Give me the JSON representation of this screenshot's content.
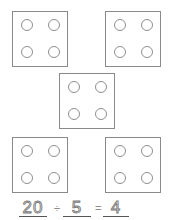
{
  "worksheet": {
    "groups": [
      {
        "id": 1,
        "counters": 4
      },
      {
        "id": 2,
        "counters": 4
      },
      {
        "id": 3,
        "counters": 4
      },
      {
        "id": 4,
        "counters": 4
      },
      {
        "id": 5,
        "counters": 4
      }
    ],
    "equation": {
      "dividend": "20",
      "operator": "÷",
      "divisor": "5",
      "equals": "=",
      "quotient": "4"
    }
  },
  "colors": {
    "box_border": "#8a8a8a",
    "counter_stroke": "#8e8e8e",
    "traced_digits": "#7a7a7a",
    "underline": "#555555",
    "background": "#ffffff"
  }
}
